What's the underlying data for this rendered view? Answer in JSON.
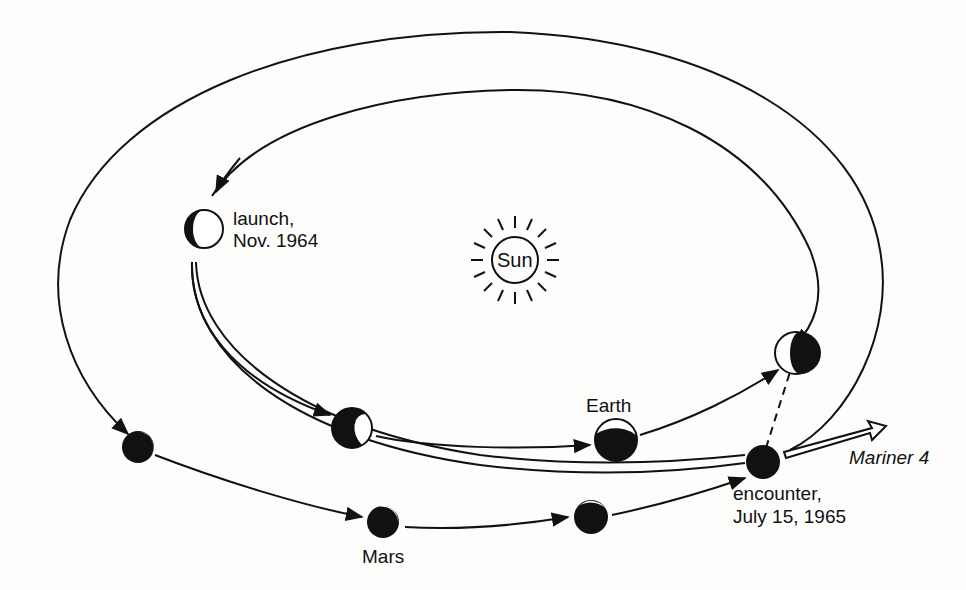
{
  "colors": {
    "ink": "#111111",
    "paper": "#fdfdfc"
  },
  "labels": {
    "sun": "Sun",
    "launch_line1": "launch,",
    "launch_line2": "Nov. 1964",
    "earth": "Earth",
    "mars": "Mars",
    "encounter_line1": "encounter,",
    "encounter_line2": "July 15, 1965",
    "spacecraft": "Mariner 4"
  },
  "bodies": {
    "earth_positions": [
      "launch (Nov. 1964)",
      "intermediate 1",
      "intermediate 2 (Earth)",
      "at encounter"
    ],
    "mars_positions": [
      "at launch",
      "intermediate 1 (Mars)",
      "intermediate 2",
      "at encounter"
    ]
  },
  "orbits": [
    "Earth orbit (inner ellipse)",
    "Mars orbit (outer ellipse)",
    "Mariner 4 transfer trajectory (double line)"
  ]
}
